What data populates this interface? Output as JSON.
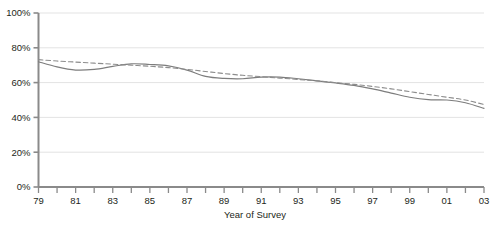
{
  "chart_data": {
    "type": "line",
    "title": "",
    "xlabel": "Year of Survey",
    "ylabel": "",
    "xlim": [
      79,
      103
    ],
    "ylim": [
      0,
      100
    ],
    "grid": true,
    "legend": "none",
    "y_ticks": [
      "0%",
      "20%",
      "40%",
      "60%",
      "80%",
      "100%"
    ],
    "y_tick_values": [
      0,
      20,
      40,
      60,
      80,
      100
    ],
    "x_ticks_all": [
      "79",
      "80",
      "81",
      "82",
      "83",
      "84",
      "85",
      "86",
      "87",
      "88",
      "89",
      "90",
      "91",
      "92",
      "93",
      "94",
      "95",
      "96",
      "97",
      "98",
      "99",
      "00",
      "01",
      "02",
      "03"
    ],
    "x_tick_labels": [
      "79",
      "81",
      "83",
      "85",
      "87",
      "89",
      "91",
      "93",
      "95",
      "97",
      "99",
      "01",
      "03"
    ],
    "x_tick_label_values": [
      79,
      81,
      83,
      85,
      87,
      89,
      91,
      93,
      95,
      97,
      99,
      101,
      103
    ],
    "x": [
      79,
      80,
      81,
      82,
      83,
      84,
      85,
      86,
      87,
      88,
      89,
      90,
      91,
      92,
      93,
      94,
      95,
      96,
      97,
      98,
      99,
      100,
      101,
      102,
      103
    ],
    "series": [
      {
        "name": "observed",
        "style": "solid",
        "color": "#7d7d7d",
        "values": [
          72.0,
          69.0,
          67.2,
          67.6,
          69.3,
          70.8,
          70.4,
          69.6,
          67.2,
          63.6,
          62.4,
          62.2,
          63.2,
          63.2,
          62.2,
          61.0,
          59.8,
          58.4,
          56.4,
          54.0,
          51.6,
          50.2,
          50.0,
          48.4,
          45.2
        ]
      },
      {
        "name": "trend",
        "style": "dashed",
        "color": "#8c8c8c",
        "values": [
          73.2,
          72.4,
          71.8,
          71.2,
          70.6,
          70.0,
          69.4,
          68.6,
          67.6,
          66.4,
          65.2,
          64.2,
          63.4,
          62.6,
          61.8,
          61.0,
          60.0,
          59.0,
          57.8,
          56.4,
          54.8,
          53.2,
          51.6,
          50.0,
          47.4
        ]
      }
    ]
  },
  "axis_title": "Year of Survey",
  "colors": {
    "axis": "#8a8a8a",
    "gridline": "#e3e3e3",
    "solid_line": "#7d7d7d",
    "dashed_line": "#8c8c8c",
    "text": "#231f20"
  }
}
